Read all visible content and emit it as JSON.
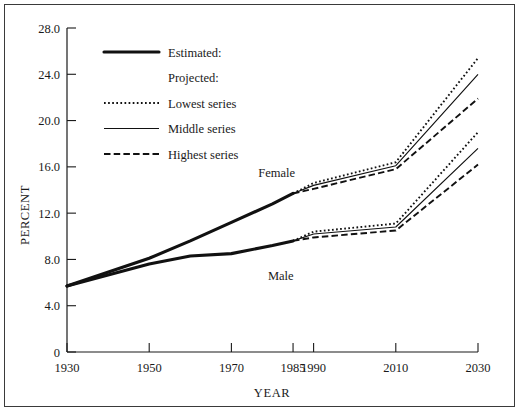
{
  "chart_data": {
    "type": "line",
    "title": "",
    "xlabel": "YEAR",
    "ylabel": "PERCENT",
    "xlim": [
      1930,
      2030
    ],
    "ylim": [
      0,
      28
    ],
    "grid": false,
    "x_ticks": [
      1930,
      1950,
      1970,
      1985,
      1990,
      2010,
      2030
    ],
    "x_tick_labels": [
      "1930",
      "1950",
      "1970",
      "1985",
      "1990",
      "2010",
      "2030"
    ],
    "y_ticks": [
      0,
      4,
      8,
      12,
      16,
      20,
      24,
      28
    ],
    "y_tick_labels": [
      "0",
      "4.0",
      "8.0",
      "12.0",
      "16.0",
      "20.0",
      "24.0",
      "28.0"
    ],
    "legend_position": "upper-left-inside",
    "annotations": [
      {
        "text": "Female",
        "x": 1981,
        "y": 15.1
      },
      {
        "text": "Male",
        "x": 1982,
        "y": 6.2
      }
    ],
    "series": [
      {
        "name": "Female Estimated",
        "group": "Female",
        "style": "Estimated:",
        "x": [
          1930,
          1950,
          1960,
          1970,
          1980,
          1985
        ],
        "values": [
          5.7,
          8.1,
          9.6,
          11.2,
          12.8,
          13.7
        ]
      },
      {
        "name": "Female Lowest series",
        "group": "Female",
        "style": "Lowest series",
        "x": [
          1985,
          1990,
          2010,
          2030
        ],
        "values": [
          13.7,
          14.6,
          16.4,
          25.4
        ]
      },
      {
        "name": "Female Middle series",
        "group": "Female",
        "style": "Middle series",
        "x": [
          1985,
          1990,
          2010,
          2030
        ],
        "values": [
          13.7,
          14.4,
          16.1,
          24.0
        ]
      },
      {
        "name": "Female Highest series",
        "group": "Female",
        "style": "Highest series",
        "x": [
          1985,
          1990,
          2010,
          2030
        ],
        "values": [
          13.7,
          14.1,
          15.8,
          21.9
        ]
      },
      {
        "name": "Male Estimated",
        "group": "Male",
        "style": "Estimated:",
        "x": [
          1930,
          1950,
          1960,
          1970,
          1980,
          1985
        ],
        "values": [
          5.7,
          7.6,
          8.3,
          8.5,
          9.2,
          9.6
        ]
      },
      {
        "name": "Male Lowest series",
        "group": "Male",
        "style": "Lowest series",
        "x": [
          1985,
          1990,
          2010,
          2030
        ],
        "values": [
          9.6,
          10.4,
          11.1,
          19.0
        ]
      },
      {
        "name": "Male Middle series",
        "group": "Male",
        "style": "Middle series",
        "x": [
          1985,
          1990,
          2010,
          2030
        ],
        "values": [
          9.6,
          10.2,
          10.8,
          17.6
        ]
      },
      {
        "name": "Male Highest series",
        "group": "Male",
        "style": "Highest series",
        "x": [
          1985,
          1990,
          2010,
          2030
        ],
        "values": [
          9.6,
          9.9,
          10.5,
          16.2
        ]
      }
    ],
    "legend": [
      {
        "label": "Estimated:",
        "style": "solid-thick"
      },
      {
        "label": "Projected:",
        "style": "none"
      },
      {
        "label": "Lowest series",
        "style": "dotted"
      },
      {
        "label": "Middle series",
        "style": "solid-thin"
      },
      {
        "label": "Highest series",
        "style": "dashed"
      }
    ],
    "colors": {
      "line": "#111111",
      "axis": "#1a1a1a",
      "frame": "#3a3a3a",
      "background": "#ffffff"
    }
  }
}
